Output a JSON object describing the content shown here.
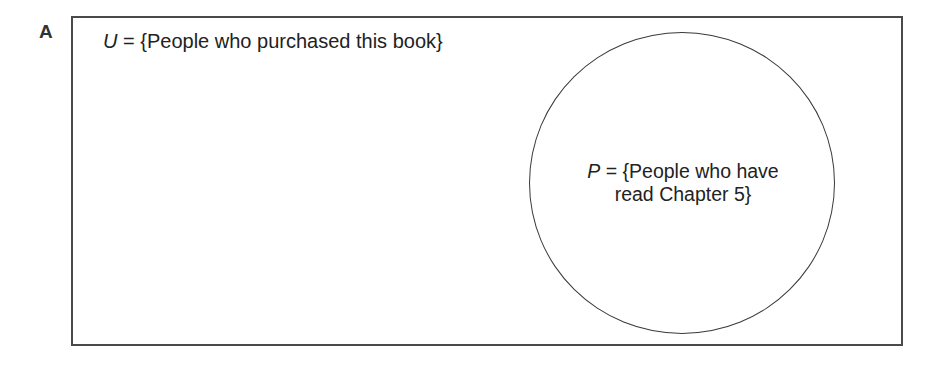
{
  "figure": {
    "panel_label": "A",
    "universe": {
      "symbol": "U",
      "equals": " = ",
      "description": "{People who purchased this book}"
    },
    "subset": {
      "symbol": "P",
      "equals": " = ",
      "description_line1": "{People who have",
      "description_line2": "read Chapter 5}"
    },
    "colors": {
      "border": "#4a4a4a",
      "text": "#222222",
      "background": "#ffffff"
    }
  }
}
